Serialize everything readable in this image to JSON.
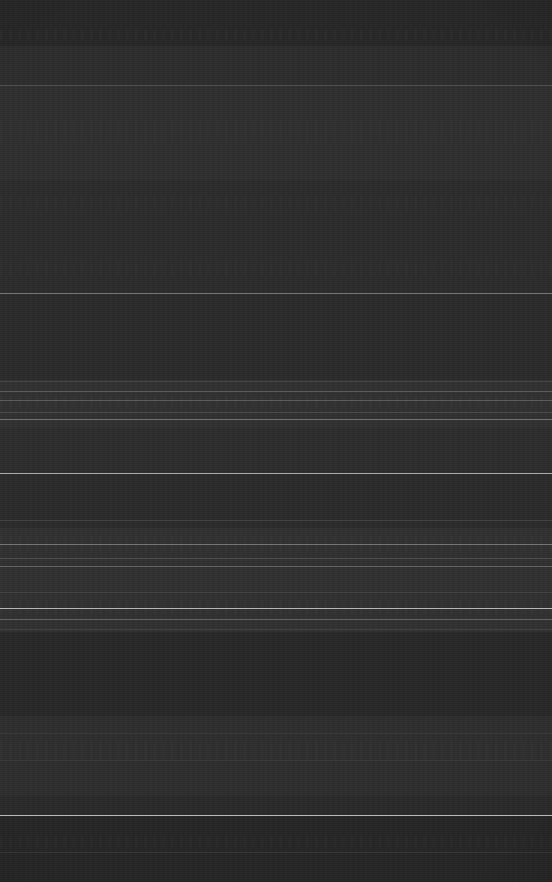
{
  "capture": {
    "width": 552,
    "height": 882,
    "legibility": "none",
    "condition": "corrupted",
    "description": "Dark-theme UI capture degraded to a near-black noise field with horizontal smear artifacts; no text, icons or controls are legible."
  },
  "palette": {
    "base": "#2b2b2b",
    "top_strip": "#262626",
    "mid_dark": "#282828",
    "lower_dark": "#242424",
    "divider_bright": "#b9b9b9",
    "divider_mid": "#6e6e6e",
    "divider_faint": "#444444",
    "smear_tint": "#3a3a3a"
  },
  "bands": [
    {
      "name": "top-strip",
      "y": 0,
      "height": 46,
      "color": "#262626"
    },
    {
      "name": "upper-field",
      "y": 46,
      "height": 39,
      "color": "#2c2c2c"
    },
    {
      "name": "header-field",
      "y": 85,
      "height": 95,
      "color": "#2e2e2e"
    },
    {
      "name": "upper-mid-field",
      "y": 180,
      "height": 113,
      "color": "#2b2b2b"
    },
    {
      "name": "mid-field",
      "y": 293,
      "height": 87,
      "color": "#2a2a2a"
    },
    {
      "name": "dense-cluster-a",
      "y": 380,
      "height": 48,
      "color": "#303030"
    },
    {
      "name": "mid-lower-field",
      "y": 428,
      "height": 45,
      "color": "#2c2c2c"
    },
    {
      "name": "mid-lower-b",
      "y": 473,
      "height": 55,
      "color": "#2a2a2a"
    },
    {
      "name": "dense-cluster-b",
      "y": 528,
      "height": 104,
      "color": "#303030"
    },
    {
      "name": "quiet-field",
      "y": 632,
      "height": 84,
      "color": "#272727"
    },
    {
      "name": "dense-cluster-c",
      "y": 716,
      "height": 80,
      "color": "#2d2d2d"
    },
    {
      "name": "lower-field",
      "y": 796,
      "height": 19,
      "color": "#292929"
    },
    {
      "name": "footer-field",
      "y": 815,
      "height": 67,
      "color": "#252525"
    }
  ],
  "dividers": [
    {
      "name": "divider-header",
      "y": 85,
      "color": "#6e6e6e",
      "opacity": 0.55
    },
    {
      "name": "divider-mid",
      "y": 293,
      "color": "#9a9a9a",
      "opacity": 0.7
    },
    {
      "name": "divider-cluster-a-top",
      "y": 381,
      "color": "#555555",
      "opacity": 0.6
    },
    {
      "name": "divider-cluster-a-1",
      "y": 391,
      "color": "#8a8a8a",
      "opacity": 0.5
    },
    {
      "name": "divider-cluster-a-2",
      "y": 400,
      "color": "#7d7d7d",
      "opacity": 0.55
    },
    {
      "name": "divider-cluster-a-3",
      "y": 412,
      "color": "#6a6a6a",
      "opacity": 0.45
    },
    {
      "name": "divider-cluster-a-4",
      "y": 419,
      "color": "#9f9f9f",
      "opacity": 0.6
    },
    {
      "name": "divider-bright-upper",
      "y": 473,
      "color": "#c6c6c6",
      "opacity": 0.85
    },
    {
      "name": "divider-cluster-b-1",
      "y": 520,
      "color": "#5c5c5c",
      "opacity": 0.45
    },
    {
      "name": "divider-cluster-b-2",
      "y": 544,
      "color": "#a2a2a2",
      "opacity": 0.6
    },
    {
      "name": "divider-cluster-b-3",
      "y": 558,
      "color": "#707070",
      "opacity": 0.45
    },
    {
      "name": "divider-cluster-b-4",
      "y": 566,
      "color": "#8c8c8c",
      "opacity": 0.55
    },
    {
      "name": "divider-cluster-b-5",
      "y": 592,
      "color": "#5a5a5a",
      "opacity": 0.4
    },
    {
      "name": "divider-bright-mid",
      "y": 608,
      "color": "#c9c9c9",
      "opacity": 0.88
    },
    {
      "name": "divider-cluster-b-6",
      "y": 619,
      "color": "#8f8f8f",
      "opacity": 0.55
    },
    {
      "name": "divider-cluster-b-7",
      "y": 629,
      "color": "#5e5e5e",
      "opacity": 0.4
    },
    {
      "name": "divider-lower-faint",
      "y": 733,
      "color": "#4c4c4c",
      "opacity": 0.4
    },
    {
      "name": "divider-lower-2",
      "y": 760,
      "color": "#4a4a4a",
      "opacity": 0.35
    },
    {
      "name": "divider-bright-footer",
      "y": 815,
      "color": "#d2d2d2",
      "opacity": 0.9
    },
    {
      "name": "divider-footer-2",
      "y": 852,
      "color": "#4e4e4e",
      "opacity": 0.35
    }
  ],
  "smears": [
    {
      "name": "smear-row-top",
      "y": 30,
      "height": 10,
      "opacity": 0.16
    },
    {
      "name": "smear-row-header",
      "y": 120,
      "height": 22,
      "opacity": 0.14
    },
    {
      "name": "smear-row-upper",
      "y": 196,
      "height": 14,
      "opacity": 0.12
    },
    {
      "name": "smear-row-mid",
      "y": 262,
      "height": 14,
      "opacity": 0.12
    },
    {
      "name": "smear-row-cluster-a",
      "y": 396,
      "height": 12,
      "opacity": 0.26
    },
    {
      "name": "smear-row-cluster-b",
      "y": 536,
      "height": 16,
      "opacity": 0.22
    },
    {
      "name": "smear-row-cluster-c",
      "y": 600,
      "height": 14,
      "opacity": 0.26
    },
    {
      "name": "smear-row-lower",
      "y": 742,
      "height": 18,
      "opacity": 0.18
    },
    {
      "name": "smear-row-footer",
      "y": 836,
      "height": 12,
      "opacity": 0.12
    }
  ]
}
